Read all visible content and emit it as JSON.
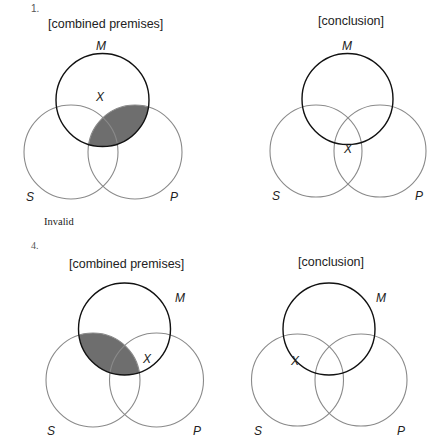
{
  "problems": [
    {
      "number": "1.",
      "premises": {
        "heading": "[combined premises]",
        "labels": {
          "M": "M",
          "S": "S",
          "P": "P"
        },
        "x_mark": "X",
        "shaded_region": "M ∩ P (outside S and inside S)",
        "shade_color": "#6e6e6e"
      },
      "conclusion": {
        "heading": "[conclusion]",
        "labels": {
          "M": "M",
          "S": "S",
          "P": "P"
        },
        "x_mark": "X",
        "x_position": "on M circle boundary within S ∩ P"
      },
      "verdict": "Invalid"
    },
    {
      "number": "4.",
      "premises": {
        "heading": "[combined premises]",
        "labels": {
          "M": "M",
          "S": "S",
          "P": "P"
        },
        "x_mark": "X",
        "shaded_region": "M ∩ S",
        "shade_color": "#6e6e6e"
      },
      "conclusion": {
        "heading": "[conclusion]",
        "labels": {
          "M": "M",
          "S": "S",
          "P": "P"
        },
        "x_mark": "X",
        "x_position": "on M circle boundary within S"
      }
    }
  ]
}
